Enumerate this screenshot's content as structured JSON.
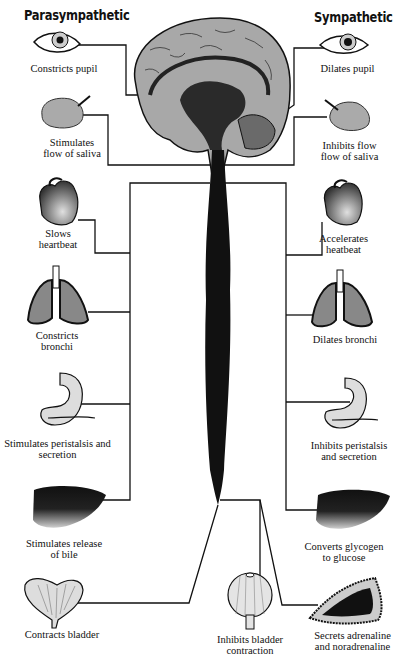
{
  "headings": {
    "left": "Parasympathetic",
    "right": "Sympathetic"
  },
  "parasympathetic": [
    {
      "organ": "eye",
      "icon": "eye-icon",
      "label": "Constricts pupil"
    },
    {
      "organ": "salivary-gland",
      "icon": "salivary-gland-icon",
      "label": "Stimulates\nflow of saliva"
    },
    {
      "organ": "heart",
      "icon": "heart-icon",
      "label": "Slows\nheartbeat"
    },
    {
      "organ": "lungs",
      "icon": "lungs-icon",
      "label": "Constricts\nbronchi"
    },
    {
      "organ": "stomach",
      "icon": "stomach-icon",
      "label": "Stimulates peristalsis and\nsecretion"
    },
    {
      "organ": "liver",
      "icon": "liver-icon",
      "label": "Stimulates release\nof bile"
    },
    {
      "organ": "bladder",
      "icon": "bladder-icon",
      "label": "Contracts bladder"
    }
  ],
  "sympathetic": [
    {
      "organ": "eye",
      "icon": "eye-icon",
      "label": "Dilates pupil"
    },
    {
      "organ": "salivary-gland",
      "icon": "salivary-gland-icon",
      "label": "Inhibits flow\nflow of saliva"
    },
    {
      "organ": "heart",
      "icon": "heart-icon",
      "label": "Accelerates\nheatbeat"
    },
    {
      "organ": "lungs",
      "icon": "lungs-icon",
      "label": "Dilates bronchi"
    },
    {
      "organ": "stomach",
      "icon": "stomach-icon",
      "label": "Inhibits peristalsis\nand secretion"
    },
    {
      "organ": "liver",
      "icon": "liver-icon",
      "label": "Converts glycogen\nto glucose"
    },
    {
      "organ": "adrenal-gland",
      "icon": "adrenal-gland-icon",
      "label": "Secrets adrenaline\nand noradrenaline"
    }
  ],
  "center": {
    "organ": "bladder",
    "icon": "bladder-icon",
    "label": "Inhibits bladder\ncontraction"
  },
  "colors": {
    "ink": "#111111",
    "organ_fill": "#9a9a9a",
    "organ_light": "#d8d8d8",
    "background": "#ffffff"
  }
}
